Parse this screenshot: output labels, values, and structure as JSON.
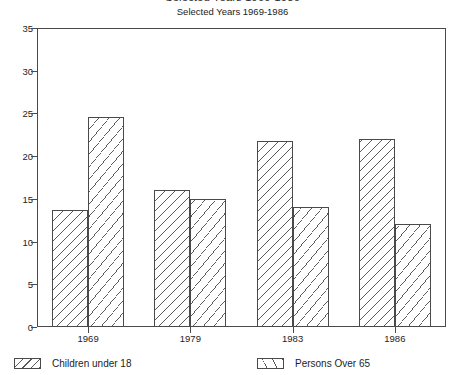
{
  "chart_data": {
    "type": "bar",
    "title": "Selected Years 1969-1986",
    "subtitle": "Selected Years 1969-1986",
    "xlabel": "",
    "ylabel": "",
    "categories": [
      "1969",
      "1979",
      "1983",
      "1986"
    ],
    "series": [
      {
        "name": "Children under 18",
        "values": [
          13.7,
          16.0,
          21.8,
          22.0
        ]
      },
      {
        "name": "Persons Over 65",
        "values": [
          24.6,
          15.0,
          14.0,
          12.1
        ]
      }
    ],
    "ylim": [
      0,
      35
    ],
    "yticks": [
      0,
      5,
      10,
      15,
      20,
      25,
      30,
      35
    ],
    "ytick_labels": [
      "0",
      "5",
      "10",
      "15",
      "20",
      "25",
      "30",
      "35"
    ],
    "grid": false,
    "legend_position": "bottom",
    "legend": [
      "Children under 18",
      "Persons Over 65"
    ],
    "colors": {
      "axis": "#4a4a4a",
      "text": "#1d1d1d",
      "hatch": "#5a5a5a",
      "background": "#ffffff"
    }
  }
}
